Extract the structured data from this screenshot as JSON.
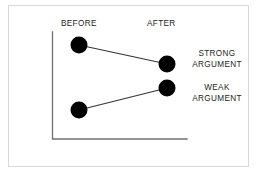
{
  "figure": {
    "background_color": "#ffffff",
    "frame_color": "#d8d8d8",
    "axis_color": "#6f6f6f",
    "marker_color": "#000000",
    "line_color": "#333333",
    "text_color": "#231f20"
  },
  "headers": {
    "before": "BEFORE",
    "after": "AFTER"
  },
  "labels": {
    "strong_line1": "STRONG",
    "strong_line2": "ARGUMENT",
    "weak_line1": "WEAK",
    "weak_line2": "ARGUMENT"
  },
  "chart_data": {
    "type": "line",
    "title": "",
    "subtitle": "",
    "xlabel": "",
    "ylabel": "",
    "categories": [
      "BEFORE",
      "AFTER"
    ],
    "tick_labels": [
      "BEFORE",
      "AFTER"
    ],
    "grid": false,
    "legend_position": "right",
    "axis_ranges": {
      "x": [
        0,
        1
      ],
      "y": [
        0,
        1
      ]
    },
    "annotations": [],
    "series": [
      {
        "name": "STRONG ARGUMENT",
        "values": [
          0.88,
          0.7
        ],
        "points_px": [
          [
            79,
            45
          ],
          [
            167,
            64
          ]
        ],
        "marker": "filled-circle",
        "marker_radius_px": 8.5,
        "label_lines": [
          "STRONG",
          "ARGUMENT"
        ]
      },
      {
        "name": "WEAK ARGUMENT",
        "values": [
          0.27,
          0.48
        ],
        "points_px": [
          [
            79,
            110
          ],
          [
            167,
            88
          ]
        ],
        "marker": "filled-circle",
        "marker_radius_px": 8.5,
        "label_lines": [
          "WEAK",
          "ARGUMENT"
        ]
      }
    ]
  }
}
